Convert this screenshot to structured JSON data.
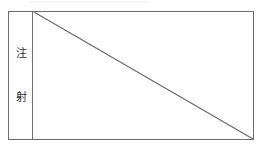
{
  "document": {
    "type": "scanned-form-table-fragment",
    "background_color": "#ffffff",
    "border_color": "#6d6d6d",
    "text_color": "#2b2b2b"
  },
  "table": {
    "name": "injection-row",
    "columns": 2,
    "label_column": {
      "name": "vertical-label",
      "orientation": "vertical",
      "characters": [
        {
          "char": "注"
        },
        {
          "char": "射"
        }
      ],
      "full_text": "注射"
    },
    "content_cell": {
      "name": "empty-content-cell",
      "value": "",
      "annotation": "diagonal-strikethrough",
      "diagonal": {
        "from": "top-left",
        "to": "bottom-right",
        "color": "#6d6d6d",
        "width": 1
      }
    }
  }
}
